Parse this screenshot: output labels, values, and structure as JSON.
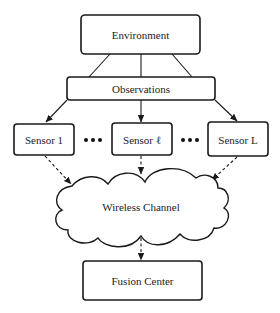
{
  "diagram": {
    "nodes": {
      "environment": "Environment",
      "observations": "Observations",
      "sensor_1": "Sensor 1",
      "sensor_l": "Sensor ℓ",
      "sensor_L": "Sensor L",
      "channel": "Wireless Channel",
      "fusion": "Fusion Center"
    },
    "ellipsis": "•••",
    "edges": [
      {
        "from": "Environment",
        "to": "Observations",
        "style": "solid",
        "count": 3
      },
      {
        "from": "Observations",
        "to": "Sensor 1",
        "style": "solid-arrow"
      },
      {
        "from": "Observations",
        "to": "Sensor ℓ",
        "style": "solid-arrow"
      },
      {
        "from": "Observations",
        "to": "Sensor L",
        "style": "solid-arrow"
      },
      {
        "from": "Sensor 1",
        "to": "Wireless Channel",
        "style": "dashed-arrow"
      },
      {
        "from": "Sensor ℓ",
        "to": "Wireless Channel",
        "style": "dashed-arrow"
      },
      {
        "from": "Sensor L",
        "to": "Wireless Channel",
        "style": "dashed-arrow"
      },
      {
        "from": "Wireless Channel",
        "to": "Fusion Center",
        "style": "dashed-arrow"
      }
    ]
  }
}
